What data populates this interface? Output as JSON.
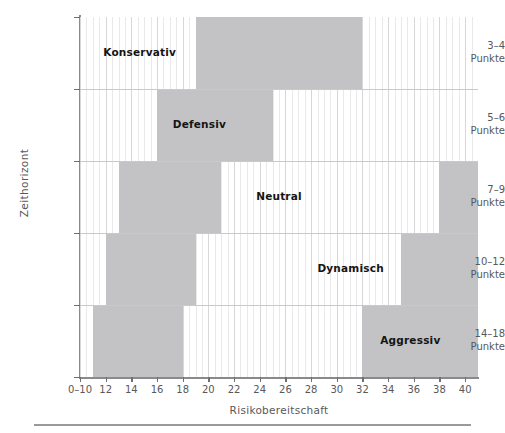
{
  "chart_data": {
    "type": "heatmap",
    "title": "",
    "xlabel": "Risikobereitschaft",
    "ylabel": "Zeithorizont",
    "xlim": [
      10,
      41
    ],
    "grid": true,
    "legend": "none",
    "xticklabels": [
      "0–10",
      "12",
      "14",
      "16",
      "18",
      "20",
      "22",
      "24",
      "26",
      "28",
      "30",
      "32",
      "34",
      "36",
      "38",
      "40"
    ],
    "xtickvalues": [
      10,
      12,
      14,
      16,
      18,
      20,
      22,
      24,
      26,
      28,
      30,
      32,
      34,
      36,
      38,
      40
    ],
    "yticklabels": [
      {
        "range": "3–4",
        "unit": "Punkte"
      },
      {
        "range": "5–6",
        "unit": "Punkte"
      },
      {
        "range": "7–9",
        "unit": "Punkte"
      },
      {
        "range": "10–12",
        "unit": "Punkte"
      },
      {
        "range": "14–18",
        "unit": "Punkte"
      }
    ],
    "shade_color": "#c3c3c5",
    "background_color": "#ffffff",
    "categories": [
      "Konservativ",
      "Defensiv",
      "Neutral",
      "Dynamisch",
      "Aggressiv"
    ],
    "regions": [
      {
        "name": "Konservativ",
        "row": 0,
        "row_label": "3–4 Punkte",
        "label_x_pct": 15,
        "shaded_spans": [
          {
            "from": 19.0,
            "to": 32.0
          }
        ]
      },
      {
        "name": "Defensiv",
        "row": 1,
        "row_label": "5–6 Punkte",
        "label_x_pct": 30,
        "shaded_spans": [
          {
            "from": 16.0,
            "to": 25.0
          }
        ]
      },
      {
        "name": "Neutral",
        "row": 2,
        "row_label": "7–9 Punkte",
        "label_x_pct": 50,
        "shaded_spans": [
          {
            "from": 13.0,
            "to": 21.0
          },
          {
            "from": 38.0,
            "to": 41.0
          }
        ]
      },
      {
        "name": "Dynamisch",
        "row": 3,
        "row_label": "10–12 Punkte",
        "label_x_pct": 68,
        "shaded_spans": [
          {
            "from": 12.0,
            "to": 19.0
          },
          {
            "from": 35.0,
            "to": 41.0
          }
        ]
      },
      {
        "name": "Aggressiv",
        "row": 4,
        "row_label": "14–18 Punkte",
        "label_x_pct": 83,
        "shaded_spans": [
          {
            "from": 11.0,
            "to": 18.0
          },
          {
            "from": 32.0,
            "to": 41.0
          }
        ]
      }
    ]
  }
}
